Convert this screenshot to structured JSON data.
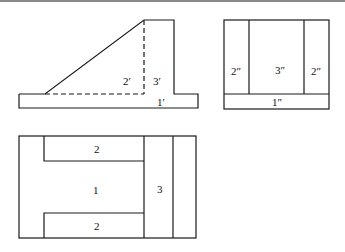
{
  "figure": {
    "type": "orthographic-projection",
    "colors": {
      "line": "#1a1a1a",
      "background": "#ffffff",
      "top_rule": "#8a8a8a"
    },
    "front_view": {
      "labels": [
        "2′",
        "3′",
        "1′"
      ]
    },
    "side_view": {
      "labels": [
        "2″",
        "3″",
        "2″",
        "1″"
      ]
    },
    "top_view": {
      "labels": [
        "2",
        "1",
        "2",
        "3"
      ]
    }
  }
}
